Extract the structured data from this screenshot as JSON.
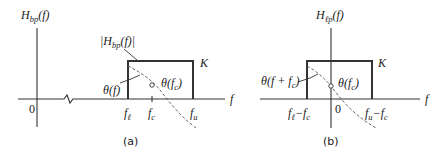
{
  "panel_a": {
    "caption": "(a)",
    "y_axis_label": "H",
    "y_axis_label_sub": "bp",
    "y_axis_label_arg": "(f)",
    "magnitude_label": "|H",
    "magnitude_label_sub": "bp",
    "magnitude_label_arg": "(f)|",
    "gain_label": "K",
    "origin_label": "0",
    "phase_label": "θ(f)",
    "phase_center_label": "θ(f",
    "phase_center_label_sub": "c",
    "phase_center_close": ")",
    "ticks": {
      "f_lower": "f",
      "f_lower_sub": "ℓ",
      "f_center": "f",
      "f_center_sub": "c",
      "f_upper": "f",
      "f_upper_sub": "u"
    },
    "x_axis_label": "f"
  },
  "panel_b": {
    "caption": "(b)",
    "y_axis_label": "H",
    "y_axis_label_sub": "ℓp",
    "y_axis_label_arg": "(f)",
    "gain_label": "K",
    "origin_label": "0",
    "phase_label": "θ(f + f",
    "phase_label_sub": "c",
    "phase_label_close": ")",
    "phase_center_label": "θ(f",
    "phase_center_label_sub": "c",
    "phase_center_close": ")",
    "ticks": {
      "f_lower": "f",
      "f_lower_sub": "ℓ",
      "f_lower_minus": "−f",
      "f_lower_minus_sub": "c",
      "f_upper": "f",
      "f_upper_sub": "u",
      "f_upper_minus": "−f",
      "f_upper_minus_sub": "c"
    },
    "x_axis_label": "f"
  },
  "colors": {
    "line": "#333333",
    "text": "#222222",
    "background": "#ffffff"
  }
}
